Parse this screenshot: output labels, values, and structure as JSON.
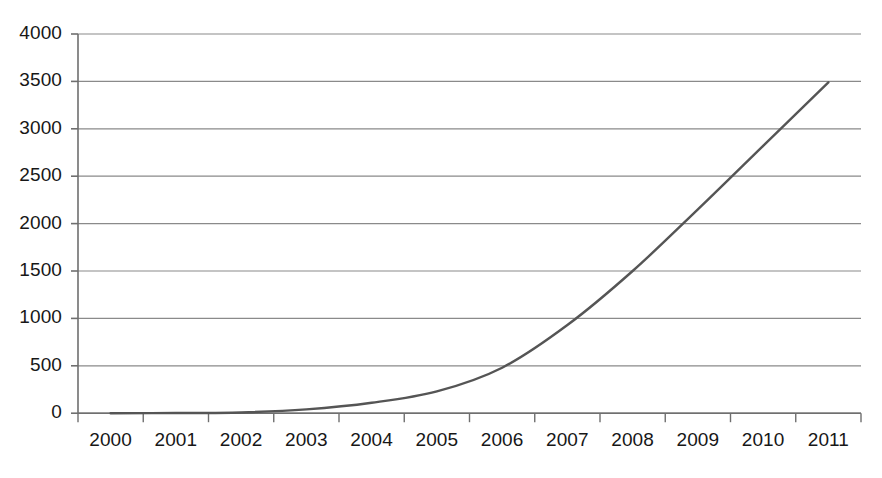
{
  "chart_data": {
    "type": "line",
    "title": "",
    "subtitle": "",
    "xlabel": "",
    "ylabel": "",
    "categories": [
      "2000",
      "2001",
      "2002",
      "2003",
      "2004",
      "2005",
      "2006",
      "2007",
      "2008",
      "2009",
      "2010",
      "2011"
    ],
    "x": [
      2000,
      2001,
      2002,
      2003,
      2004,
      2005,
      2006,
      2007,
      2008,
      2009,
      2010,
      2011
    ],
    "series": [
      {
        "name": "",
        "values": [
          0,
          2,
          8,
          40,
          110,
          230,
          480,
          930,
          1500,
          2150,
          2820,
          3490
        ],
        "color": "#555555"
      }
    ],
    "values": [
      0,
      2,
      8,
      40,
      110,
      230,
      480,
      930,
      1500,
      2150,
      2820,
      3490
    ],
    "ylim": [
      0,
      4000
    ],
    "yticks": [
      0,
      500,
      1000,
      1500,
      2000,
      2500,
      3000,
      3500,
      4000
    ],
    "ytick_labels": [
      "0",
      "500",
      "1000",
      "1500",
      "2000",
      "2500",
      "3000",
      "3500",
      "4000"
    ],
    "xtick_labels": [
      "2000",
      "2001",
      "2002",
      "2003",
      "2004",
      "2005",
      "2006",
      "2007",
      "2008",
      "2009",
      "2010",
      "2011"
    ],
    "grid": true,
    "grid_axis": "y",
    "grid_color": "#8a8a8a",
    "legend": false,
    "legend_position": "none",
    "axis_color": "#6f6f6f",
    "line_color": "#555555",
    "line_width": 2.4,
    "markers": false,
    "background": "#ffffff"
  }
}
